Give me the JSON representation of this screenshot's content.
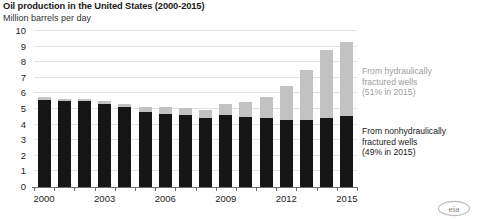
{
  "header": {
    "title": "Oil production in the United States (2000-2015)",
    "subtitle": "Million barrels per day"
  },
  "annotations": {
    "fractured": "From hydraulically\nfractured wells\n(51% in 2015)",
    "nonfractured": "From nonhydraulically\nfractured wells\n(49% in 2015)"
  },
  "logo": {
    "name": "eia-logo",
    "text": "eia"
  },
  "colors": {
    "hydraulically_fractured": "#c2c2c2",
    "nonhydraulically_fractured": "#161616",
    "gridline": "#e2e2e2",
    "axis": "#6e6e6e",
    "annotation_gray": "#9d9d9d",
    "annotation_black": "#1a1a1a"
  },
  "chart_data": {
    "type": "bar",
    "subtype": "stacked",
    "title": "Oil production in the United States (2000-2015)",
    "subtitle": "Million barrels per day",
    "xlabel": "",
    "ylabel": "Million barrels per day",
    "ylim": [
      0,
      10
    ],
    "ytick_values": [
      0,
      1,
      2,
      3,
      4,
      5,
      6,
      7,
      8,
      9,
      10
    ],
    "ytick_labels": [
      "0",
      "1",
      "2",
      "3",
      "4",
      "5",
      "6",
      "7",
      "8",
      "9",
      "10"
    ],
    "grid": true,
    "grid_axis": "y",
    "legend": "annotations at right",
    "categories": [
      2000,
      2001,
      2002,
      2003,
      2004,
      2005,
      2006,
      2007,
      2008,
      2009,
      2010,
      2011,
      2012,
      2013,
      2014,
      2015
    ],
    "xtick_labels": [
      "2000",
      "2003",
      "2006",
      "2009",
      "2012",
      "2015"
    ],
    "xtick_labeled_years": [
      2000,
      2003,
      2006,
      2009,
      2012,
      2015
    ],
    "series": [
      {
        "name": "From nonhydraulically fractured wells",
        "color": "#161616",
        "share_2015": "49%",
        "values": [
          5.6,
          5.5,
          5.5,
          5.3,
          5.1,
          4.8,
          4.7,
          4.6,
          4.4,
          4.6,
          4.5,
          4.4,
          4.3,
          4.3,
          4.4,
          4.55
        ]
      },
      {
        "name": "From hydraulically fractured wells",
        "color": "#c2c2c2",
        "share_2015": "51%",
        "values": [
          0.15,
          0.15,
          0.15,
          0.2,
          0.25,
          0.3,
          0.4,
          0.45,
          0.55,
          0.7,
          0.95,
          1.4,
          2.2,
          3.2,
          4.4,
          4.75
        ]
      }
    ],
    "totals": [
      5.75,
      5.65,
      5.65,
      5.5,
      5.35,
      5.1,
      5.1,
      5.05,
      4.95,
      5.3,
      5.45,
      5.8,
      6.5,
      7.5,
      8.8,
      9.3
    ],
    "annotation_texts": [
      "From hydraulically fractured wells (51% in 2015)",
      "From nonhydraulically fractured wells (49% in 2015)"
    ]
  }
}
